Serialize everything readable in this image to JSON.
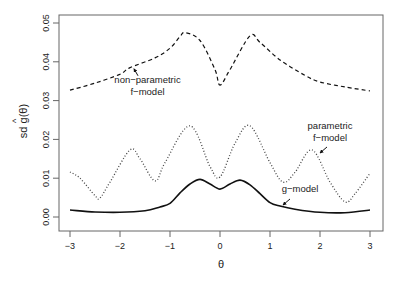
{
  "chart_data": {
    "type": "line",
    "title": "",
    "xlabel": "θ",
    "ylabel": "sd ĝ(θ)",
    "xlim": [
      -3.25,
      3.25
    ],
    "ylim": [
      -0.0036,
      0.0525
    ],
    "x_ticks": [
      -3,
      -2,
      -1,
      0,
      1,
      2,
      3
    ],
    "x_tick_labels": [
      "−3",
      "−2",
      "−1",
      "0",
      "1",
      "2",
      "3"
    ],
    "y_ticks": [
      0.0,
      0.01,
      0.02,
      0.03,
      0.04,
      0.05
    ],
    "y_tick_labels": [
      "0.00",
      "0.01",
      "0.02",
      "0.03",
      "0.04",
      "0.05"
    ],
    "grid": false,
    "legend": "none (inline annotations)",
    "series": [
      {
        "name": "non-parametric f-model",
        "style": "dashed",
        "x": [
          -3,
          -2.5,
          -2,
          -1.8,
          -1.3,
          -1.0,
          -0.8,
          -0.7,
          -0.4,
          -0.1,
          0,
          0.2,
          0.6,
          0.8,
          1.2,
          1.7,
          2.0,
          2.5,
          3
        ],
        "values": [
          0.0327,
          0.0345,
          0.0368,
          0.0385,
          0.041,
          0.0435,
          0.0465,
          0.0475,
          0.0455,
          0.038,
          0.034,
          0.038,
          0.0467,
          0.045,
          0.0405,
          0.0365,
          0.0348,
          0.0335,
          0.0325
        ]
      },
      {
        "name": "parametric f-model",
        "style": "dotted",
        "x": [
          -3,
          -2.8,
          -2.5,
          -2.4,
          -2.2,
          -1.8,
          -1.6,
          -1.3,
          -1.1,
          -0.6,
          -0.2,
          0,
          0.3,
          0.6,
          1.0,
          1.26,
          1.5,
          1.84,
          2.2,
          2.5,
          2.7,
          3
        ],
        "values": [
          0.0116,
          0.01,
          0.0055,
          0.0049,
          0.009,
          0.0173,
          0.015,
          0.0093,
          0.014,
          0.0235,
          0.013,
          0.0103,
          0.019,
          0.0235,
          0.014,
          0.009,
          0.0115,
          0.0173,
          0.009,
          0.0039,
          0.006,
          0.0113
        ]
      },
      {
        "name": "g-model",
        "style": "solid",
        "x": [
          -3,
          -2.5,
          -2,
          -1.5,
          -1.2,
          -1,
          -0.8,
          -0.6,
          -0.4,
          -0.2,
          0,
          0.2,
          0.4,
          0.6,
          0.8,
          1,
          1.2,
          1.5,
          2,
          2.5,
          3
        ],
        "values": [
          0.0018,
          0.0013,
          0.0012,
          0.0016,
          0.0026,
          0.0035,
          0.0062,
          0.0085,
          0.0097,
          0.0085,
          0.0072,
          0.0085,
          0.0095,
          0.0083,
          0.006,
          0.0037,
          0.0028,
          0.002,
          0.0012,
          0.0011,
          0.0018
        ]
      }
    ],
    "annotations": [
      {
        "lines": [
          "non−parametric",
          "f−model"
        ],
        "x": -1.45,
        "y": 0.0345,
        "arrow_to": [
          -1.72,
          0.0382
        ]
      },
      {
        "lines": [
          "parametric",
          "f−model"
        ],
        "x": 2.2,
        "y": 0.0228,
        "arrow_to": [
          2.0,
          0.0165
        ]
      },
      {
        "lines": [
          "g−model"
        ],
        "x": 1.6,
        "y": 0.0065,
        "arrow_to": [
          1.26,
          0.0031
        ]
      }
    ]
  },
  "plot": {
    "xlabel": "θ",
    "ylabel_prefix": "sd ",
    "ylabel_g": "g",
    "ylabel_hat": "^",
    "ylabel_suffix": "(θ)",
    "line_color": "#111111",
    "axis_color": "#555555"
  }
}
